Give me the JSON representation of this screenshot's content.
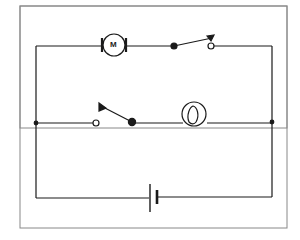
{
  "diagram": {
    "type": "electrical-circuit",
    "colors": {
      "line": "#1a1a1a",
      "frame": "#888888",
      "background": "#ffffff"
    },
    "components": [
      {
        "id": "motor",
        "kind": "motor",
        "label": "M",
        "branch": "top"
      },
      {
        "id": "switch-top",
        "kind": "switch-open",
        "branch": "top"
      },
      {
        "id": "switch-middle",
        "kind": "switch-open",
        "branch": "middle"
      },
      {
        "id": "lamp",
        "kind": "lamp",
        "branch": "middle"
      },
      {
        "id": "battery",
        "kind": "cell",
        "branch": "bottom"
      }
    ],
    "junctions": 2
  }
}
